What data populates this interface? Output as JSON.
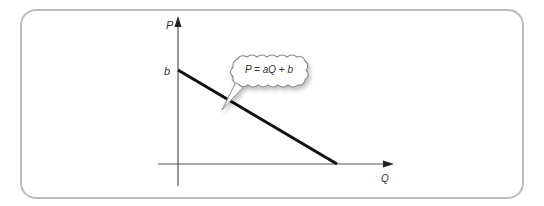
{
  "diagram": {
    "y_axis_label": "P",
    "x_axis_label": "Q",
    "intercept_label": "b",
    "equation": "P = aQ + b",
    "colors": {
      "frame": "#bdbdbd",
      "axis": "#555555",
      "line": "#111111",
      "bubble_border": "#888888",
      "text": "#333333"
    }
  }
}
